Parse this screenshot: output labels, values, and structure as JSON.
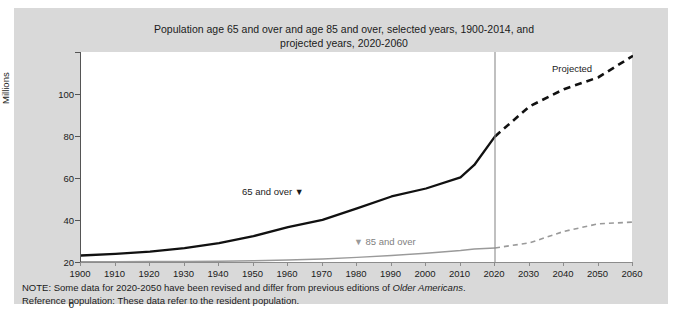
{
  "chart_data": {
    "type": "line",
    "title": "Population age 65 and over and age 85 and over, selected years, 1900-2014, and projected years, 2020-2060",
    "title_line1": "Population age 65 and over and age 85 and over, selected years, 1900-2014, and",
    "title_line2": "projected years, 2020-2060",
    "xlabel": "",
    "ylabel": "Millions",
    "xlim": [
      1900,
      2060
    ],
    "ylim": [
      0,
      100
    ],
    "grid": false,
    "legend_position": "inline-annotations",
    "y_ticks": [
      0,
      20,
      40,
      60,
      80,
      100
    ],
    "x_ticks": [
      1900,
      1910,
      1920,
      1930,
      1940,
      1950,
      1960,
      1970,
      1980,
      1990,
      2000,
      2010,
      2020,
      2030,
      2040,
      2050,
      2060
    ],
    "projection_divider_year": 2020,
    "projected_label": "Projected",
    "annotations": [
      {
        "text": "65 and over",
        "marker": "▼",
        "marker_side": "right",
        "color": "#1b1b1b"
      },
      {
        "text": "85 and over",
        "marker": "▼",
        "marker_side": "left",
        "color": "#7f7f7f"
      }
    ],
    "series": [
      {
        "name": "65 and over",
        "color": "#111111",
        "style": "solid",
        "x": [
          1900,
          1910,
          1920,
          1930,
          1940,
          1950,
          1960,
          1970,
          1980,
          1990,
          2000,
          2010,
          2014,
          2020
        ],
        "values": [
          3.1,
          3.9,
          4.9,
          6.6,
          9.0,
          12.3,
          16.6,
          20.1,
          25.5,
          31.2,
          35.0,
          40.3,
          46.2,
          59.8
        ]
      },
      {
        "name": "65 and over (projected)",
        "color": "#111111",
        "style": "dashed",
        "x": [
          2020,
          2030,
          2040,
          2050,
          2060
        ],
        "values": [
          59.8,
          74.1,
          82.3,
          88.0,
          98.2
        ]
      },
      {
        "name": "85 and over",
        "color": "#9a9a9a",
        "style": "solid",
        "x": [
          1900,
          1910,
          1920,
          1930,
          1940,
          1950,
          1960,
          1970,
          1980,
          1990,
          2000,
          2010,
          2014,
          2020
        ],
        "values": [
          0.12,
          0.17,
          0.21,
          0.27,
          0.37,
          0.58,
          0.93,
          1.4,
          2.2,
          3.1,
          4.2,
          5.5,
          6.2,
          6.7
        ]
      },
      {
        "name": "85 and over (projected)",
        "color": "#9a9a9a",
        "style": "dashed",
        "x": [
          2020,
          2030,
          2040,
          2050,
          2060
        ],
        "values": [
          6.7,
          9.1,
          14.6,
          18.2,
          19.0
        ]
      }
    ]
  },
  "notes": {
    "line1_prefix": "NOTE: Some data for 2020-2050 have been revised and differ from previous editions of ",
    "line1_italic": "Older Americans",
    "line1_suffix": ".",
    "line2": "Reference population: These data refer to the resident population."
  },
  "colors": {
    "panel_background": "#d9d9d9",
    "plot_background": "#ffffff",
    "primary_series": "#111111",
    "secondary_series": "#9a9a9a",
    "axis": "#8c8c8c",
    "text": "#1b1b1b"
  }
}
